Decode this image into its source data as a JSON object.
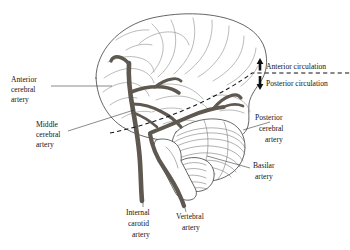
{
  "figure": {
    "background_color": "#ffffff",
    "artery_color": "#5e5850",
    "outline_color": "#4a4a4a",
    "text_color": "#141414"
  },
  "labels": {
    "anterior_cerebral_artery": {
      "lines": [
        "Anterior",
        "cerebral",
        "artery"
      ]
    },
    "middle_cerebral_artery": {
      "lines": [
        "Middle",
        "cerebral",
        "artery"
      ]
    },
    "internal_carotid_artery": {
      "lines": [
        "Internal",
        "carotid",
        "artery"
      ]
    },
    "vertebral_artery": {
      "lines": [
        "Vertebral",
        "artery"
      ]
    },
    "posterior_cerebral_artery": {
      "lines": [
        "Posterior",
        "cerebral",
        "artery"
      ]
    },
    "basilar_artery": {
      "lines": [
        "Basilar",
        "artery"
      ]
    }
  },
  "circulation": {
    "anterior": "Anterior circulation",
    "posterior": "Posterior circulation",
    "anterior_arrow": "up-arrow-icon",
    "posterior_arrow": "down-arrow-icon",
    "divider_style": "dashed"
  },
  "structures": {
    "cerebrum": "cerebrum",
    "cerebellum": "cerebellum",
    "brainstem": "brainstem"
  }
}
